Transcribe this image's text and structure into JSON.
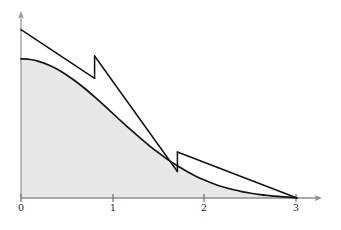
{
  "figure": {
    "title": "",
    "background_color": "#ffffff",
    "width": 341,
    "height": 230
  },
  "axes": {
    "origin_px": {
      "x": 21,
      "y": 198
    },
    "x_axis": {
      "label": "",
      "arrow": true,
      "color": "#555555",
      "start_px": 21,
      "end_px": 322,
      "ticks": [
        {
          "label": "0",
          "value": 0,
          "px": 21
        },
        {
          "label": "1",
          "value": 1,
          "px": 113
        },
        {
          "label": "2",
          "value": 2,
          "px": 204
        },
        {
          "label": "3",
          "value": 3,
          "px": 296
        }
      ]
    },
    "y_axis": {
      "label": "",
      "arrow": true,
      "color": "#999999",
      "top_px": 12,
      "bottom_px": 198,
      "ticks": []
    }
  },
  "style": {
    "curve_color": "#111111",
    "tangent_color": "#111111",
    "fill_color": "#e7e7e7",
    "fill_stroke": "#b5b5b5",
    "axis_color": "#8a8a8a",
    "tick_color": "#6e6e6e",
    "label_color": "#1a1a1a",
    "curve_width": 1.7,
    "tangent_width": 1.5
  },
  "chart_data": {
    "type": "area",
    "title": "",
    "xlabel": "",
    "ylabel": "",
    "xlim": [
      0,
      3.3
    ],
    "ylim": [
      0,
      1.25
    ],
    "grid": false,
    "legend": null,
    "series": [
      {
        "name": "f(x) — shaded area under curve",
        "type": "area",
        "fill": "#e7e7e7",
        "stroke": "#111111",
        "x": [
          0,
          0.1,
          0.2,
          0.3,
          0.4,
          0.5,
          0.6,
          0.7,
          0.8,
          0.9,
          1.0,
          1.1,
          1.2,
          1.3,
          1.4,
          1.5,
          1.6,
          1.7,
          1.8,
          1.9,
          2.0,
          2.1,
          2.2,
          2.3,
          2.4,
          2.5,
          2.6,
          2.7,
          2.8,
          2.9,
          3.0
        ],
        "y": [
          1.0,
          0.995,
          0.98,
          0.956,
          0.923,
          0.882,
          0.835,
          0.783,
          0.726,
          0.667,
          0.606,
          0.545,
          0.486,
          0.428,
          0.373,
          0.322,
          0.274,
          0.231,
          0.192,
          0.157,
          0.127,
          0.101,
          0.079,
          0.061,
          0.046,
          0.034,
          0.024,
          0.017,
          0.011,
          0.006,
          0.0
        ]
      },
      {
        "name": "piecewise tangent-line approximation",
        "type": "line",
        "stroke": "#111111",
        "segments": [
          {
            "from": {
              "x": 0.0,
              "y": 1.21
            },
            "to": {
              "x": 0.8,
              "y": 0.86
            }
          },
          {
            "from": {
              "x": 0.8,
              "y": 1.02
            },
            "to": {
              "x": 1.7,
              "y": 0.19
            }
          },
          {
            "from": {
              "x": 1.7,
              "y": 0.33
            },
            "to": {
              "x": 3.0,
              "y": 0.0
            }
          }
        ],
        "jump_points": [
          {
            "x": 0.8,
            "y_low": 0.86,
            "y_high": 1.02
          },
          {
            "x": 1.7,
            "y_low": 0.19,
            "y_high": 0.33
          }
        ]
      }
    ]
  },
  "tick_labels": {
    "t0": "0",
    "t1": "1",
    "t2": "2",
    "t3": "3"
  }
}
